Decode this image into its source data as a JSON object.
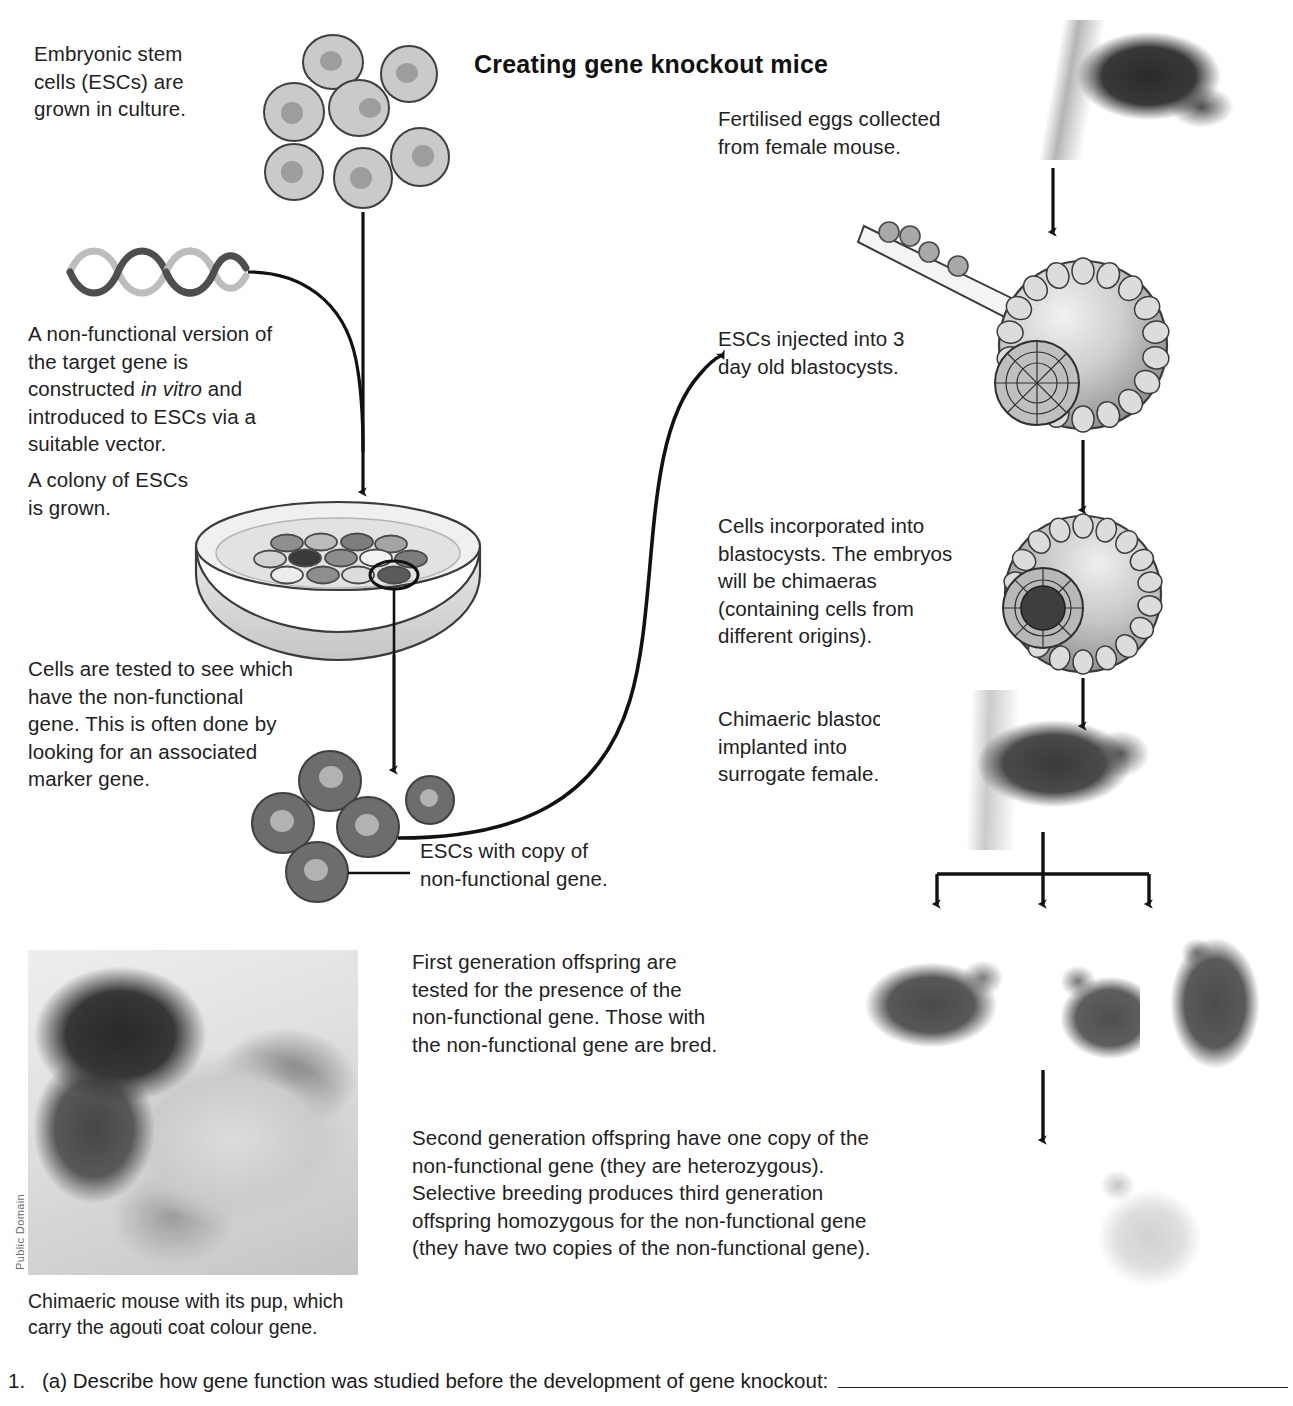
{
  "page": {
    "title": "Creating gene knockout mice"
  },
  "steps": {
    "esc_culture": "Embryonic stem cells  (ESCs) are grown in culture.",
    "esc_culture_lines": [
      "Embryonic stem",
      "cells  (ESCs) are",
      "grown in culture."
    ],
    "nonfunctional_gene_lines": [
      "A non-functional version of",
      "the target gene is",
      "constructed ",
      "in vitro",
      " and",
      "introduced to ESCs via a",
      "suitable vector."
    ],
    "colony_lines": [
      "A colony of ESCs",
      "is grown."
    ],
    "cells_tested_lines": [
      "Cells are tested to see which",
      "have the non-functional",
      "gene. This is often done by",
      "looking for an associated",
      "marker gene."
    ],
    "esc_with_copy_lines": [
      "ESCs with copy of",
      "non-functional gene."
    ],
    "fertilised_eggs_lines": [
      "Fertilised eggs collected",
      "from female mouse."
    ],
    "esc_injected_lines": [
      "ESCs injected into 3",
      "day old blastocysts."
    ],
    "cells_incorporated_lines": [
      "Cells incorporated into",
      "blastocysts. The embryos",
      "will be chimaeras",
      "(containing cells from",
      "different origins)."
    ],
    "chimaeric_implanted_lines": [
      "Chimaeric blastocysts",
      "implanted into",
      "surrogate female."
    ],
    "first_generation_lines": [
      "First generation offspring are",
      "tested for the presence of the",
      "non-functional gene. Those with",
      "the non-functional gene are bred."
    ],
    "second_generation_lines": [
      "Second generation offspring have one copy of the",
      "non-functional gene (they are heterozygous).",
      "Selective breeding produces third generation",
      "offspring homozygous for the non-functional gene",
      "(they have two copies of the non-functional gene)."
    ]
  },
  "photo": {
    "caption_lines": [
      "Chimaeric mouse with its pup, which",
      "carry the agouti coat colour gene."
    ],
    "credit": "Public Domain"
  },
  "question": {
    "number": "1.",
    "text": "(a) Describe how gene function was studied before the development of gene knockout:"
  },
  "colors": {
    "ink": "#222222",
    "cell_fill": "#c9c9c9",
    "cell_stroke": "#4a4a4a",
    "nucleus": "#9a9a9a",
    "dark_cell_fill": "#6d6d6d",
    "dish_fill": "#e0e0e0",
    "dna_dark": "#4e4e4e",
    "dna_light": "#bdbdbd"
  }
}
